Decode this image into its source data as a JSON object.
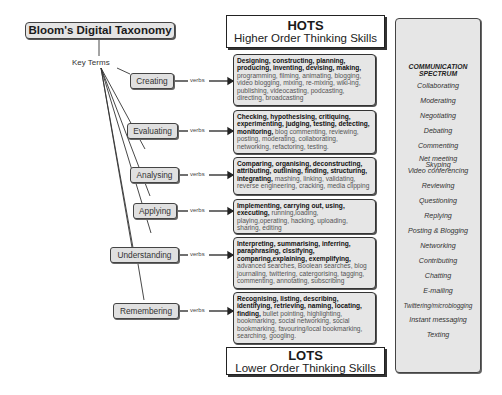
{
  "title": "Bloom's Digital Taxonomy",
  "key_terms_label": "Key Terms",
  "verbs_label": "verbs",
  "hots": {
    "abbr": "HOTS",
    "full": "Higher Order Thinking Skills"
  },
  "lots": {
    "abbr": "LOTS",
    "full": "Lower Order Thinking Skills"
  },
  "levels": [
    {
      "name": "Creating",
      "bold_verbs": "Designing, constructing, planning, producing, inventing, devising, making,",
      "digital_verbs": "programming, filming, animating, blogging, video blogging, mixing, re-mixing, wiki-ing, publishing, videocasting, podcasting, directing, broadcasting"
    },
    {
      "name": "Evaluating",
      "bold_verbs": "Checking, hypothesising, critiquing, experimenting, judging, testing, detecting, monitoring,",
      "digital_verbs": "blog commenting, reviewing, posting, moderating, collaborating, networking, refactoring, testing."
    },
    {
      "name": "Analysing",
      "bold_verbs": "Comparing, organising, deconstructing, attributing, outlining, finding, structuring, integrating,",
      "digital_verbs": "mashing, linking, validating, reverse engineering, cracking, media clipping"
    },
    {
      "name": "Applying",
      "bold_verbs": "Implementing, carrying out, using, executing,",
      "digital_verbs": "running,loading, playing,operating, hacking, uploading, sharing, editing"
    },
    {
      "name": "Understanding",
      "bold_verbs": "Interpreting, summarising, inferring, paraphrasing, clssifying, comparing,explaining, exemplifying,",
      "digital_verbs": "advanced searches, Boolean searches, blog journaling, twittering, catergorising, tagging, commenting, annotating, subscribing"
    },
    {
      "name": "Remembering",
      "bold_verbs": "Recognising, listing, describing, identifying, retrieving, naming, locating, finding,",
      "digital_verbs": "bullet pointing, highlighting, bookmarking, social networking, social bookmarking, favouring/local bookmarking, searching, googling."
    }
  ],
  "communication_spectrum": {
    "title_line1": "COMMUNICATION",
    "title_line2": "SPECTRUM",
    "items": [
      "Collaborating",
      "Moderating",
      "Negotiating",
      "Debating",
      "Commenting",
      "Net meeting",
      "Skyping",
      "Video conferencing",
      "Reviewing",
      "Questioning",
      "Replying",
      "Posting & Blogging",
      "Networking",
      "Contributing",
      "Chatting",
      "E-mailing",
      "Twittering/microblogging",
      "Instant messaging",
      "Texting"
    ]
  }
}
